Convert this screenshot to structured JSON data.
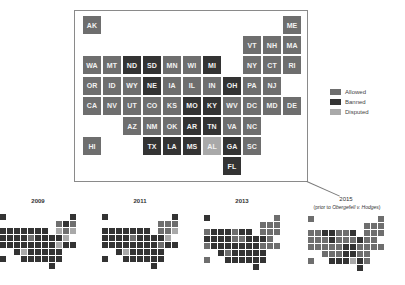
{
  "colors": {
    "Allowed": "#6e6e6e",
    "Banned": "#333333",
    "Disputed": "#a9a9a9"
  },
  "legend": {
    "items": [
      {
        "label": "Allowed",
        "key": "Allowed"
      },
      {
        "label": "Banned",
        "key": "Banned"
      },
      {
        "label": "Disputed",
        "key": "Disputed"
      }
    ]
  },
  "grid": {
    "AK": [
      0,
      0
    ],
    "ME": [
      10,
      0
    ],
    "VT": [
      8,
      1
    ],
    "NH": [
      9,
      1
    ],
    "MA": [
      10,
      1
    ],
    "WA": [
      0,
      2
    ],
    "MT": [
      1,
      2
    ],
    "ND": [
      2,
      2
    ],
    "SD": [
      3,
      2
    ],
    "MN": [
      4,
      2
    ],
    "WI": [
      5,
      2
    ],
    "MI": [
      6,
      2
    ],
    "NY": [
      8,
      2
    ],
    "CT": [
      9,
      2
    ],
    "RI": [
      10,
      2
    ],
    "OR": [
      0,
      3
    ],
    "ID": [
      1,
      3
    ],
    "WY": [
      2,
      3
    ],
    "NE": [
      3,
      3
    ],
    "IA": [
      4,
      3
    ],
    "IL": [
      5,
      3
    ],
    "IN": [
      6,
      3
    ],
    "OH": [
      7,
      3
    ],
    "PA": [
      8,
      3
    ],
    "NJ": [
      9,
      3
    ],
    "CA": [
      0,
      4
    ],
    "NV": [
      1,
      4
    ],
    "UT": [
      2,
      4
    ],
    "CO": [
      3,
      4
    ],
    "KS": [
      4,
      4
    ],
    "MO": [
      5,
      4
    ],
    "KY": [
      6,
      4
    ],
    "WV": [
      7,
      4
    ],
    "DC": [
      8,
      4
    ],
    "MD": [
      9,
      4
    ],
    "DE": [
      10,
      4
    ],
    "AZ": [
      2,
      5
    ],
    "NM": [
      3,
      5
    ],
    "OK": [
      4,
      5
    ],
    "AR": [
      5,
      5
    ],
    "TN": [
      6,
      5
    ],
    "VA": [
      7,
      5
    ],
    "NC": [
      8,
      5
    ],
    "HI": [
      0,
      6
    ],
    "TX": [
      3,
      6
    ],
    "LA": [
      4,
      6
    ],
    "MS": [
      5,
      6
    ],
    "AL": [
      6,
      6
    ],
    "GA": [
      7,
      6
    ],
    "SC": [
      8,
      6
    ],
    "FL": [
      7,
      7
    ]
  },
  "main_map": {
    "year": "2015",
    "states": {
      "AK": "Allowed",
      "ME": "Allowed",
      "VT": "Allowed",
      "NH": "Allowed",
      "MA": "Allowed",
      "WA": "Allowed",
      "MT": "Allowed",
      "ND": "Banned",
      "SD": "Banned",
      "MN": "Allowed",
      "WI": "Allowed",
      "MI": "Banned",
      "NY": "Allowed",
      "CT": "Allowed",
      "RI": "Allowed",
      "OR": "Allowed",
      "ID": "Allowed",
      "WY": "Allowed",
      "NE": "Banned",
      "IA": "Allowed",
      "IL": "Allowed",
      "IN": "Allowed",
      "OH": "Banned",
      "PA": "Allowed",
      "NJ": "Allowed",
      "CA": "Allowed",
      "NV": "Allowed",
      "UT": "Allowed",
      "CO": "Allowed",
      "KS": "Allowed",
      "MO": "Banned",
      "KY": "Banned",
      "WV": "Allowed",
      "DC": "Allowed",
      "MD": "Allowed",
      "DE": "Allowed",
      "AZ": "Allowed",
      "NM": "Allowed",
      "OK": "Allowed",
      "AR": "Banned",
      "TN": "Banned",
      "VA": "Allowed",
      "NC": "Allowed",
      "HI": "Allowed",
      "TX": "Banned",
      "LA": "Banned",
      "MS": "Banned",
      "AL": "Disputed",
      "GA": "Banned",
      "SC": "Allowed",
      "FL": "Banned"
    }
  },
  "small_maps": [
    {
      "title": "2009",
      "subtitle": "",
      "origin": [
        0,
        214
      ],
      "states": {
        "AK": "Banned",
        "ME": "Banned",
        "VT": "Allowed",
        "NH": "Banned",
        "MA": "Allowed",
        "WA": "Banned",
        "MT": "Banned",
        "ND": "Banned",
        "SD": "Banned",
        "MN": "Banned",
        "WI": "Banned",
        "MI": "Banned",
        "NY": "Disputed",
        "CT": "Allowed",
        "RI": "Disputed",
        "OR": "Banned",
        "ID": "Banned",
        "WY": "Banned",
        "NE": "Banned",
        "IA": "Allowed",
        "IL": "Banned",
        "IN": "Banned",
        "OH": "Banned",
        "PA": "Banned",
        "NJ": "Disputed",
        "CA": "Banned",
        "NV": "Banned",
        "UT": "Banned",
        "CO": "Banned",
        "KS": "Banned",
        "MO": "Banned",
        "KY": "Banned",
        "WV": "Banned",
        "DC": "Disputed",
        "MD": "Banned",
        "DE": "Banned",
        "AZ": "Banned",
        "NM": "Disputed",
        "OK": "Banned",
        "AR": "Banned",
        "TN": "Banned",
        "VA": "Banned",
        "NC": "Banned",
        "HI": "Banned",
        "TX": "Banned",
        "LA": "Banned",
        "MS": "Banned",
        "AL": "Banned",
        "GA": "Banned",
        "SC": "Banned",
        "FL": "Banned"
      }
    },
    {
      "title": "2011",
      "subtitle": "",
      "origin": [
        102,
        214
      ],
      "states": {
        "AK": "Banned",
        "ME": "Banned",
        "VT": "Allowed",
        "NH": "Allowed",
        "MA": "Allowed",
        "WA": "Banned",
        "MT": "Banned",
        "ND": "Banned",
        "SD": "Banned",
        "MN": "Banned",
        "WI": "Banned",
        "MI": "Banned",
        "NY": "Allowed",
        "CT": "Allowed",
        "RI": "Disputed",
        "OR": "Banned",
        "ID": "Banned",
        "WY": "Banned",
        "NE": "Banned",
        "IA": "Allowed",
        "IL": "Banned",
        "IN": "Banned",
        "OH": "Banned",
        "PA": "Banned",
        "NJ": "Disputed",
        "CA": "Banned",
        "NV": "Banned",
        "UT": "Banned",
        "CO": "Banned",
        "KS": "Banned",
        "MO": "Banned",
        "KY": "Banned",
        "WV": "Banned",
        "DC": "Allowed",
        "MD": "Banned",
        "DE": "Banned",
        "AZ": "Banned",
        "NM": "Disputed",
        "OK": "Banned",
        "AR": "Banned",
        "TN": "Banned",
        "VA": "Banned",
        "NC": "Banned",
        "HI": "Banned",
        "TX": "Banned",
        "LA": "Banned",
        "MS": "Banned",
        "AL": "Banned",
        "GA": "Banned",
        "SC": "Banned",
        "FL": "Banned"
      }
    },
    {
      "title": "2013",
      "subtitle": "",
      "origin": [
        204,
        215
      ],
      "states": {
        "AK": "Banned",
        "ME": "Allowed",
        "VT": "Allowed",
        "NH": "Allowed",
        "MA": "Allowed",
        "WA": "Allowed",
        "MT": "Banned",
        "ND": "Banned",
        "SD": "Banned",
        "MN": "Allowed",
        "WI": "Banned",
        "MI": "Banned",
        "NY": "Allowed",
        "CT": "Allowed",
        "RI": "Allowed",
        "OR": "Banned",
        "ID": "Banned",
        "WY": "Banned",
        "NE": "Banned",
        "IA": "Allowed",
        "IL": "Allowed",
        "IN": "Banned",
        "OH": "Banned",
        "PA": "Banned",
        "NJ": "Allowed",
        "CA": "Allowed",
        "NV": "Banned",
        "UT": "Banned",
        "CO": "Banned",
        "KS": "Banned",
        "MO": "Banned",
        "KY": "Banned",
        "WV": "Banned",
        "DC": "Allowed",
        "MD": "Allowed",
        "DE": "Allowed",
        "AZ": "Banned",
        "NM": "Allowed",
        "OK": "Banned",
        "AR": "Banned",
        "TN": "Banned",
        "VA": "Banned",
        "NC": "Banned",
        "HI": "Allowed",
        "TX": "Banned",
        "LA": "Banned",
        "MS": "Banned",
        "AL": "Banned",
        "GA": "Banned",
        "SC": "Banned",
        "FL": "Banned"
      }
    },
    {
      "title": "2015",
      "subtitle_prefix": "(prior to ",
      "subtitle_case": "Obergefell v. Hodges",
      "subtitle_suffix": ")",
      "origin": [
        308,
        216
      ],
      "states": "main"
    }
  ]
}
